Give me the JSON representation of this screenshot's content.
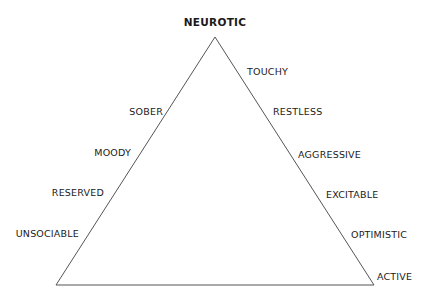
{
  "diagram": {
    "type": "triangle",
    "apex_label": "NEUROTIC",
    "vertices": {
      "apex": [
        215,
        37
      ],
      "bottom_left": [
        56,
        285
      ],
      "bottom_right": [
        374,
        285
      ]
    },
    "line_color": "#555555",
    "left_side_labels": [
      {
        "text": "SOBER",
        "x": 163,
        "y": 112
      },
      {
        "text": "MOODY",
        "x": 131,
        "y": 153
      },
      {
        "text": "RESERVED",
        "x": 104,
        "y": 193
      },
      {
        "text": "UNSOCIABLE",
        "x": 79,
        "y": 234
      }
    ],
    "right_side_labels": [
      {
        "text": "TOUCHY",
        "x": 247,
        "y": 72
      },
      {
        "text": "RESTLESS",
        "x": 273,
        "y": 112
      },
      {
        "text": "AGGRESSIVE",
        "x": 298,
        "y": 155
      },
      {
        "text": "EXCITABLE",
        "x": 326,
        "y": 195
      },
      {
        "text": "OPTIMISTIC",
        "x": 351,
        "y": 235
      },
      {
        "text": "ACTIVE",
        "x": 377,
        "y": 277
      }
    ]
  }
}
